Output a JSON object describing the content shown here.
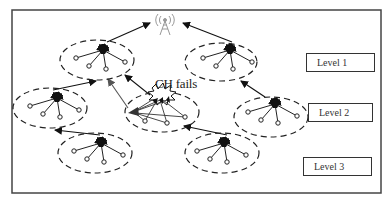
{
  "diagram": {
    "base_station": {
      "icon": "antenna-tower-icon",
      "x": 165,
      "y": 25
    },
    "failure_label": "CH fails",
    "levels": [
      {
        "label": "Level 1",
        "box": {
          "x": 306,
          "y": 53,
          "w": 69,
          "h": 19
        }
      },
      {
        "label": "Level 2",
        "box": {
          "x": 308,
          "y": 103,
          "w": 65,
          "h": 19
        }
      },
      {
        "label": "Level 3",
        "box": {
          "x": 303,
          "y": 157,
          "w": 69,
          "h": 19
        }
      }
    ],
    "clusters": [
      {
        "id": "L1-left",
        "level": 1,
        "cx": 97,
        "cy": 60,
        "rx": 37,
        "ry": 20,
        "failed": false
      },
      {
        "id": "L1-right",
        "level": 1,
        "cx": 221,
        "cy": 62,
        "rx": 36,
        "ry": 19,
        "failed": false
      },
      {
        "id": "L2-left",
        "level": 2,
        "cx": 50,
        "cy": 108,
        "rx": 37,
        "ry": 20,
        "failed": false
      },
      {
        "id": "L2-center",
        "level": 2,
        "cx": 162,
        "cy": 112,
        "rx": 37,
        "ry": 20,
        "failed": true
      },
      {
        "id": "L2-right",
        "level": 2,
        "cx": 271,
        "cy": 117,
        "rx": 37,
        "ry": 20,
        "failed": false
      },
      {
        "id": "L3-left",
        "level": 3,
        "cx": 95,
        "cy": 153,
        "rx": 37,
        "ry": 20,
        "failed": false
      },
      {
        "id": "L3-right",
        "level": 3,
        "cx": 222,
        "cy": 153,
        "rx": 37,
        "ry": 20,
        "failed": false
      }
    ],
    "links": [
      {
        "from": "L1-left",
        "to": "base-station"
      },
      {
        "from": "L1-right",
        "to": "base-station"
      },
      {
        "from": "L2-left",
        "to": "L1-left"
      },
      {
        "from": "L2-center",
        "to": "L1-left",
        "note": "rerouted from failed CH"
      },
      {
        "from": "L2-right",
        "to": "L1-right"
      },
      {
        "from": "L3-left",
        "to": "L2-left"
      },
      {
        "from": "L3-right",
        "to": "L2-center"
      }
    ]
  }
}
